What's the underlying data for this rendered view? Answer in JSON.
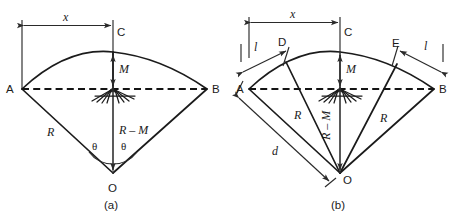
{
  "figure": {
    "caption_a": "(a)",
    "caption_b": "(b)",
    "panel_a": {
      "points": {
        "A": "A",
        "B": "B",
        "C": "C",
        "O": "O"
      },
      "dimensions": {
        "x": "x",
        "M": "M",
        "R": "R",
        "R_minus_M": "R – M",
        "theta_left": "θ",
        "theta_right": "θ"
      }
    },
    "panel_b": {
      "points": {
        "A": "A",
        "B": "B",
        "C": "C",
        "D": "D",
        "E": "E",
        "O": "O"
      },
      "dimensions": {
        "x": "x",
        "M": "M",
        "R_left": "R",
        "R_right": "R",
        "R_minus_M": "R – M",
        "l_left": "l",
        "l_right": "l",
        "d": "d"
      }
    },
    "colors": {
      "line": "#1b1b1b",
      "dash": "#141414",
      "dimension": "#2a2a2a",
      "background": "#ffffff"
    }
  }
}
